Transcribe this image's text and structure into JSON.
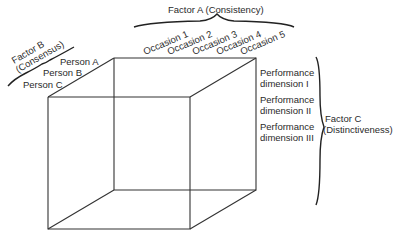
{
  "factor_a": {
    "title": "Factor A (Consistency)",
    "occasions": [
      "Occasion 1",
      "Occasion 2",
      "Occasion 3",
      "Occasion 4",
      "Occasion 5"
    ]
  },
  "factor_b": {
    "title_line1": "Factor B",
    "title_line2": "(Consensus)",
    "persons": [
      "Person A",
      "Person B",
      "Person C"
    ]
  },
  "factor_c": {
    "title_line1": "Factor C",
    "title_line2": "(Distinctiveness)",
    "dimensions": [
      {
        "line1": "Performance",
        "line2": "dimension I"
      },
      {
        "line1": "Performance",
        "line2": "dimension II"
      },
      {
        "line1": "Performance",
        "line2": "dimension III"
      }
    ]
  },
  "colors": {
    "line": "#333333",
    "text": "#2a2a2a",
    "background": "#ffffff"
  }
}
